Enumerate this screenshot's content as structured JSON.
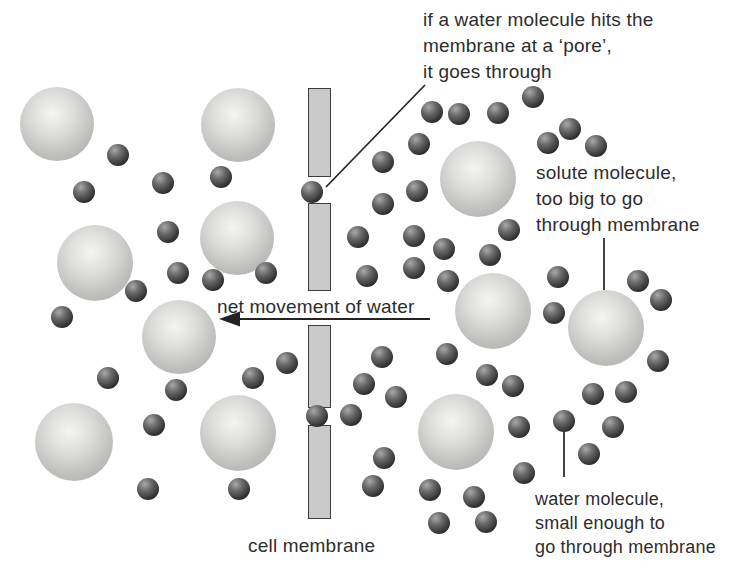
{
  "figure": {
    "type": "osmosis-through-cell-membrane-diagram",
    "background": "#ffffff",
    "annotations": {
      "pore_note": {
        "lines": [
          "if a water molecule hits the",
          "membrane at a ‘pore’,",
          "it goes through"
        ]
      },
      "solute_note": {
        "lines": [
          "solute molecule,",
          "too big to go",
          "through membrane"
        ]
      },
      "water_note": {
        "lines": [
          "water molecule,",
          "small enough to",
          "go through membrane"
        ]
      },
      "net_movement": {
        "text": "net movement of water"
      },
      "cell_membrane": {
        "text": "cell membrane"
      }
    },
    "membrane": {
      "x": 308,
      "width": 23,
      "segments": [
        [
          88,
          177
        ],
        [
          203,
          291
        ],
        [
          325,
          408
        ],
        [
          425,
          519
        ]
      ],
      "fill": "#c9c9c9",
      "border": "#3d3d3d"
    },
    "solute_molecules": [
      {
        "x": 57,
        "y": 124,
        "r": 37
      },
      {
        "x": 238,
        "y": 125,
        "r": 37
      },
      {
        "x": 237,
        "y": 238,
        "r": 37
      },
      {
        "x": 95,
        "y": 263,
        "r": 38
      },
      {
        "x": 179,
        "y": 337,
        "r": 37
      },
      {
        "x": 74,
        "y": 442,
        "r": 39
      },
      {
        "x": 238,
        "y": 433,
        "r": 38
      },
      {
        "x": 478,
        "y": 179,
        "r": 38
      },
      {
        "x": 493,
        "y": 311,
        "r": 38
      },
      {
        "x": 606,
        "y": 328,
        "r": 38
      },
      {
        "x": 456,
        "y": 432,
        "r": 38
      }
    ],
    "water_molecules": [
      {
        "x": 118,
        "y": 155
      },
      {
        "x": 163,
        "y": 183
      },
      {
        "x": 84,
        "y": 192
      },
      {
        "x": 221,
        "y": 177
      },
      {
        "x": 168,
        "y": 232
      },
      {
        "x": 178,
        "y": 273
      },
      {
        "x": 213,
        "y": 280
      },
      {
        "x": 266,
        "y": 273
      },
      {
        "x": 136,
        "y": 291
      },
      {
        "x": 62,
        "y": 317
      },
      {
        "x": 108,
        "y": 378
      },
      {
        "x": 176,
        "y": 390
      },
      {
        "x": 154,
        "y": 425
      },
      {
        "x": 253,
        "y": 378
      },
      {
        "x": 287,
        "y": 363
      },
      {
        "x": 148,
        "y": 489
      },
      {
        "x": 239,
        "y": 489
      },
      {
        "x": 312,
        "y": 192
      },
      {
        "x": 317,
        "y": 416
      },
      {
        "x": 432,
        "y": 112
      },
      {
        "x": 459,
        "y": 114
      },
      {
        "x": 498,
        "y": 113
      },
      {
        "x": 533,
        "y": 97
      },
      {
        "x": 570,
        "y": 129
      },
      {
        "x": 548,
        "y": 143
      },
      {
        "x": 596,
        "y": 146
      },
      {
        "x": 419,
        "y": 144
      },
      {
        "x": 383,
        "y": 162
      },
      {
        "x": 417,
        "y": 191
      },
      {
        "x": 383,
        "y": 204
      },
      {
        "x": 358,
        "y": 237
      },
      {
        "x": 414,
        "y": 236
      },
      {
        "x": 444,
        "y": 249
      },
      {
        "x": 490,
        "y": 255
      },
      {
        "x": 509,
        "y": 230
      },
      {
        "x": 367,
        "y": 276
      },
      {
        "x": 414,
        "y": 268
      },
      {
        "x": 448,
        "y": 281
      },
      {
        "x": 558,
        "y": 277
      },
      {
        "x": 638,
        "y": 281
      },
      {
        "x": 661,
        "y": 300
      },
      {
        "x": 554,
        "y": 313
      },
      {
        "x": 382,
        "y": 357
      },
      {
        "x": 447,
        "y": 354
      },
      {
        "x": 658,
        "y": 361
      },
      {
        "x": 364,
        "y": 384
      },
      {
        "x": 487,
        "y": 375
      },
      {
        "x": 513,
        "y": 386
      },
      {
        "x": 396,
        "y": 397
      },
      {
        "x": 593,
        "y": 394
      },
      {
        "x": 626,
        "y": 392
      },
      {
        "x": 351,
        "y": 415
      },
      {
        "x": 519,
        "y": 427
      },
      {
        "x": 564,
        "y": 421
      },
      {
        "x": 613,
        "y": 427
      },
      {
        "x": 589,
        "y": 454
      },
      {
        "x": 384,
        "y": 458
      },
      {
        "x": 373,
        "y": 486
      },
      {
        "x": 430,
        "y": 490
      },
      {
        "x": 474,
        "y": 497
      },
      {
        "x": 524,
        "y": 473
      },
      {
        "x": 439,
        "y": 523
      },
      {
        "x": 486,
        "y": 522
      }
    ],
    "water_radius": 11,
    "leader_lines": [
      {
        "name": "pore-leader-line",
        "x1": 425,
        "y1": 85,
        "x2": 326,
        "y2": 187
      },
      {
        "name": "solute-leader-line",
        "x1": 604,
        "y1": 238,
        "x2": 604,
        "y2": 290
      },
      {
        "name": "water-leader-line",
        "x1": 564,
        "y1": 432,
        "x2": 564,
        "y2": 477
      }
    ],
    "arrow": {
      "y": 319,
      "x_tail": 430,
      "x_head_back": 240,
      "x_tip": 219,
      "half_height": 7.5
    },
    "colors": {
      "text": "#2d2d2d",
      "line": "#222222"
    }
  }
}
